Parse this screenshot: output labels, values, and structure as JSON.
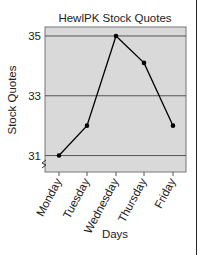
{
  "chart_data": {
    "type": "line",
    "title": "HewlPK Stock Quotes",
    "xlabel": "Days",
    "ylabel": "Stock Quotes",
    "categories": [
      "Monday",
      "Tuesday",
      "Wednesday",
      "Thursday",
      "Friday"
    ],
    "series": [
      {
        "name": "HewlPK",
        "values": [
          31,
          32,
          35,
          34.1,
          32
        ]
      }
    ],
    "yticks": [
      31,
      33,
      35
    ],
    "ylim": [
      30.45,
      35.3
    ],
    "grid": true,
    "axis_break": true,
    "legend": null
  },
  "colors": {
    "plot_bg": "#d9d9d9",
    "grid": "#555555",
    "line": "#000000",
    "text": "#222222"
  }
}
